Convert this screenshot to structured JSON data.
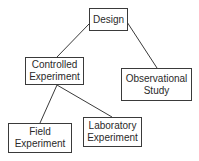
{
  "diagram": {
    "type": "tree",
    "nodes": [
      {
        "id": "design",
        "label": "Design"
      },
      {
        "id": "controlled",
        "label": "Controlled\nExperiment"
      },
      {
        "id": "observational",
        "label": "Observational\nStudy"
      },
      {
        "id": "field",
        "label": "Field\nExperiment"
      },
      {
        "id": "laboratory",
        "label": "Laboratory\nExperiment"
      }
    ],
    "edges": [
      {
        "from": "design",
        "to": "controlled"
      },
      {
        "from": "design",
        "to": "observational"
      },
      {
        "from": "controlled",
        "to": "field"
      },
      {
        "from": "controlled",
        "to": "laboratory"
      }
    ],
    "colors": {
      "line": "#3a3a3a",
      "text": "#2a2a2a",
      "background": "#ffffff"
    }
  }
}
